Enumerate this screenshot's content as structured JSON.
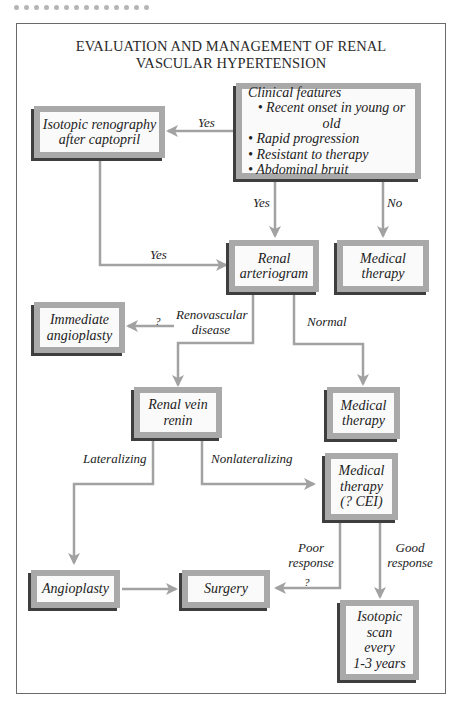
{
  "title": {
    "line1": "EVALUATION AND MANAGEMENT OF RENAL",
    "line2": "VASCULAR HYPERTENSION"
  },
  "nodes": {
    "clinical": {
      "heading": "Clinical features",
      "items": [
        "• Recent onset in young or old",
        "• Rapid progression",
        "• Resistant to therapy",
        "• Abdominal bruit"
      ]
    },
    "renography": {
      "lines": [
        "Isotopic renography",
        "after captopril"
      ]
    },
    "arteriogram": {
      "lines": [
        "Renal",
        "arteriogram"
      ]
    },
    "medical1": {
      "lines": [
        "Medical",
        "therapy"
      ]
    },
    "immediate": {
      "lines": [
        "Immediate",
        "angioplasty"
      ]
    },
    "medical2": {
      "lines": [
        "Medical",
        "therapy"
      ]
    },
    "renin": {
      "lines": [
        "Renal vein",
        "renin"
      ]
    },
    "medical3": {
      "lines": [
        "Medical",
        "therapy",
        "(? CEI)"
      ]
    },
    "angioplasty": {
      "lines": [
        "Angioplasty"
      ]
    },
    "surgery": {
      "lines": [
        "Surgery"
      ]
    },
    "isotopic_scan": {
      "lines": [
        "Isotopic",
        "scan",
        "every",
        "1-3 years"
      ]
    }
  },
  "edge_labels": {
    "yes_to_renography": "Yes",
    "yes_to_arteriogram": "Yes",
    "no_to_medical": "No",
    "yes_renography_to_arteriogram": "Yes",
    "question_immediate": "?",
    "renovascular_1": "Renovascular",
    "renovascular_2": "disease",
    "normal": "Normal",
    "lateralizing": "Lateralizing",
    "nonlateralizing": "Nonlateralizing",
    "poor_1": "Poor",
    "poor_2": "response",
    "question_surgery": "?",
    "good_1": "Good",
    "good_2": "response"
  },
  "colors": {
    "box_frame": "#a9a9a9",
    "box_shadow": "#3e3e3e",
    "box_fill": "#fafafa",
    "arrow": "#a2a2a2",
    "border": "#6a6a6a"
  }
}
